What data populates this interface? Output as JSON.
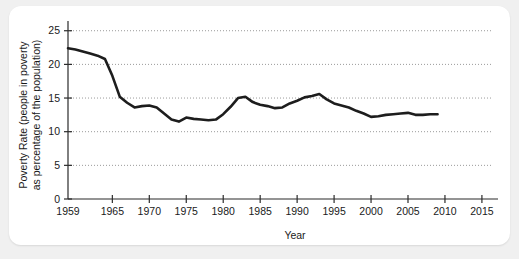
{
  "chart_data": {
    "type": "line",
    "title": "",
    "xlabel": "Year",
    "ylabel": "Poverty Rate (people in poverty as percentage of the population)",
    "ylabel_line1": "Poverty Rate (people in poverty",
    "ylabel_line2": "as percentage of the population)",
    "xlim": [
      1959,
      2016.5
    ],
    "ylim": [
      0,
      26
    ],
    "grid": true,
    "grid_axis": "y",
    "legend": "none",
    "line_color": "#1d1d1d",
    "grid_color": "#9a9a9a",
    "axis_color": "#2b2b2b",
    "background_color": "#ffffff",
    "page_background_color": "#f0f0f0",
    "yticks": [
      0,
      5,
      10,
      15,
      20,
      25
    ],
    "ytick_labels": [
      "0",
      "5",
      "10",
      "15",
      "20",
      "25"
    ],
    "xticks": [
      1959,
      1965,
      1970,
      1975,
      1980,
      1985,
      1990,
      1995,
      2000,
      2005,
      2010,
      2015
    ],
    "xtick_labels": [
      "1959",
      "1965",
      "1970",
      "1975",
      "1980",
      "1985",
      "1990",
      "1995",
      "2000",
      "2005",
      "2010",
      "2015"
    ],
    "series": [
      {
        "name": "Poverty Rate",
        "x": [
          1959,
          1960,
          1961,
          1962,
          1963,
          1964,
          1965,
          1966,
          1967,
          1968,
          1969,
          1970,
          1971,
          1972,
          1973,
          1974,
          1975,
          1976,
          1977,
          1978,
          1979,
          1980,
          1981,
          1982,
          1983,
          1984,
          1985,
          1986,
          1987,
          1988,
          1989,
          1990,
          1991,
          1992,
          1993,
          1994,
          1995,
          1996,
          1997,
          1998,
          1999,
          2000,
          2001,
          2002,
          2003,
          2004,
          2005,
          2006,
          2007,
          2008,
          2009
        ],
        "values": [
          22.4,
          22.2,
          21.9,
          21.6,
          21.3,
          20.8,
          18.3,
          15.2,
          14.3,
          13.6,
          13.8,
          13.9,
          13.6,
          12.7,
          11.8,
          11.5,
          12.1,
          11.9,
          11.8,
          11.7,
          11.8,
          12.6,
          13.7,
          15.0,
          15.2,
          14.4,
          14.0,
          13.8,
          13.5,
          13.6,
          14.2,
          14.6,
          15.1,
          15.3,
          15.6,
          14.8,
          14.2,
          13.9,
          13.6,
          13.1,
          12.7,
          12.2,
          12.3,
          12.5,
          12.6,
          12.7,
          12.8,
          12.5,
          12.5,
          12.6,
          12.6
        ],
        "color": "#1d1d1d",
        "style": "solid",
        "width": 2.6
      }
    ]
  }
}
